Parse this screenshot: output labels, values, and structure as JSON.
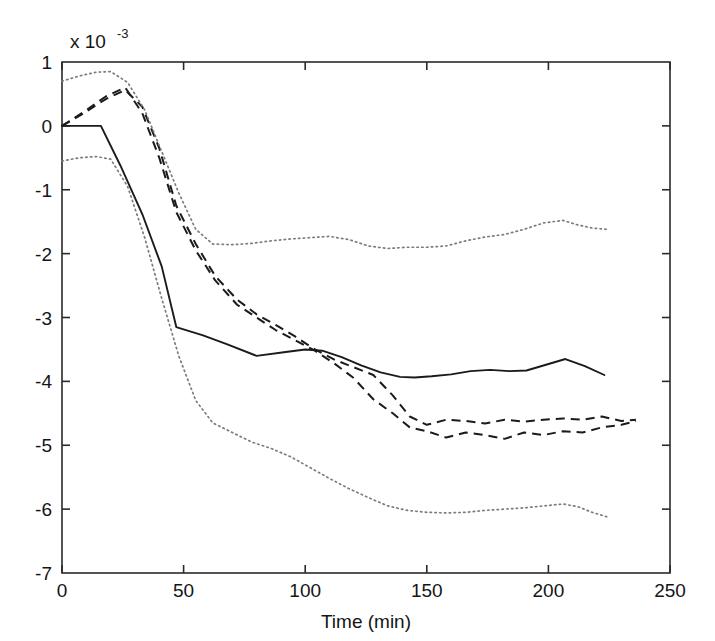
{
  "chart_data": {
    "type": "line",
    "title": "",
    "xlabel": "Time (min)",
    "ylabel": "",
    "y_exponent_base": "x 10",
    "y_exponent_power": "-3",
    "y_multiplier": 0.001,
    "xlim": [
      0,
      250
    ],
    "ylim": [
      -7,
      1
    ],
    "xticks": [
      0,
      50,
      100,
      150,
      200,
      250
    ],
    "xtick_labels": [
      "0",
      "50",
      "100",
      "150",
      "200",
      "250"
    ],
    "yticks": [
      1,
      0,
      -1,
      -2,
      -3,
      -4,
      -5,
      -6,
      -7
    ],
    "ytick_labels": [
      "1",
      "0",
      "-1",
      "-2",
      "-3",
      "-4",
      "-5",
      "-6",
      "-7"
    ],
    "grid": false,
    "legend": "none",
    "series": [
      {
        "name": "mean-solid",
        "style": "solid",
        "color": "#1b1b1b",
        "x": [
          0,
          8,
          16,
          24,
          33,
          41,
          47,
          58,
          68,
          80,
          92,
          100,
          107,
          115,
          123,
          131,
          139,
          145,
          152,
          160,
          168,
          176,
          184,
          191,
          199,
          207,
          215,
          223
        ],
        "y": [
          0.0,
          0.0,
          0.0,
          -0.62,
          -1.38,
          -2.2,
          -3.15,
          -3.28,
          -3.42,
          -3.6,
          -3.54,
          -3.5,
          -3.52,
          -3.62,
          -3.75,
          -3.86,
          -3.93,
          -3.94,
          -3.92,
          -3.89,
          -3.84,
          -3.82,
          -3.84,
          -3.83,
          -3.74,
          -3.65,
          -3.76,
          -3.9
        ]
      },
      {
        "name": "estimate-dashed-a",
        "style": "dashed",
        "color": "#1b1b1b",
        "x": [
          0,
          9,
          18,
          26,
          33,
          40,
          47,
          55,
          63,
          72,
          80,
          88,
          96,
          104,
          112,
          120,
          128,
          136,
          143,
          150,
          158,
          166,
          174,
          182,
          190,
          198,
          206,
          214,
          222,
          230,
          236
        ],
        "y": [
          0.0,
          0.2,
          0.42,
          0.56,
          0.3,
          -0.35,
          -1.25,
          -1.85,
          -2.35,
          -2.72,
          -2.95,
          -3.12,
          -3.3,
          -3.5,
          -3.66,
          -3.78,
          -3.9,
          -4.22,
          -4.55,
          -4.68,
          -4.6,
          -4.62,
          -4.66,
          -4.6,
          -4.63,
          -4.6,
          -4.58,
          -4.6,
          -4.55,
          -4.62,
          -4.6
        ]
      },
      {
        "name": "estimate-dashed-b",
        "style": "dashed",
        "color": "#1b1b1b",
        "x": [
          0,
          9,
          18,
          26,
          33,
          40,
          47,
          55,
          63,
          72,
          80,
          88,
          96,
          104,
          112,
          120,
          128,
          136,
          143,
          150,
          158,
          166,
          174,
          182,
          190,
          198,
          206,
          214,
          222,
          230,
          236
        ],
        "y": [
          0.0,
          0.22,
          0.46,
          0.6,
          0.2,
          -0.5,
          -1.35,
          -1.95,
          -2.42,
          -2.8,
          -3.0,
          -3.2,
          -3.36,
          -3.52,
          -3.72,
          -3.95,
          -4.28,
          -4.5,
          -4.72,
          -4.78,
          -4.88,
          -4.8,
          -4.84,
          -4.9,
          -4.8,
          -4.84,
          -4.78,
          -4.8,
          -4.72,
          -4.68,
          -4.62
        ]
      },
      {
        "name": "upper-bound-dotted",
        "style": "dotted",
        "color": "#7c7c7c",
        "x": [
          0,
          7,
          14,
          20,
          27,
          34,
          41,
          48,
          55,
          62,
          70,
          78,
          86,
          94,
          102,
          110,
          118,
          126,
          134,
          142,
          150,
          158,
          166,
          174,
          182,
          190,
          198,
          206,
          212,
          218,
          224
        ],
        "y": [
          0.7,
          0.78,
          0.84,
          0.85,
          0.68,
          0.25,
          -0.4,
          -1.05,
          -1.62,
          -1.85,
          -1.86,
          -1.84,
          -1.8,
          -1.77,
          -1.75,
          -1.73,
          -1.78,
          -1.88,
          -1.92,
          -1.9,
          -1.9,
          -1.88,
          -1.8,
          -1.74,
          -1.7,
          -1.62,
          -1.52,
          -1.48,
          -1.55,
          -1.6,
          -1.62
        ]
      },
      {
        "name": "lower-bound-dotted",
        "style": "dotted",
        "color": "#7c7c7c",
        "x": [
          0,
          7,
          14,
          20,
          27,
          34,
          41,
          48,
          55,
          62,
          70,
          78,
          86,
          94,
          102,
          110,
          118,
          126,
          134,
          142,
          150,
          158,
          166,
          174,
          182,
          190,
          198,
          206,
          212,
          218,
          224
        ],
        "y": [
          -0.55,
          -0.5,
          -0.48,
          -0.52,
          -0.95,
          -1.75,
          -2.7,
          -3.6,
          -4.3,
          -4.65,
          -4.8,
          -4.95,
          -5.05,
          -5.18,
          -5.35,
          -5.52,
          -5.68,
          -5.82,
          -5.95,
          -6.02,
          -6.05,
          -6.06,
          -6.05,
          -6.02,
          -6.0,
          -5.98,
          -5.95,
          -5.92,
          -5.96,
          -6.05,
          -6.12
        ]
      }
    ]
  },
  "axes": {
    "x_title": "Time (min)",
    "exp_base": "x 10",
    "exp_power": "-3"
  }
}
